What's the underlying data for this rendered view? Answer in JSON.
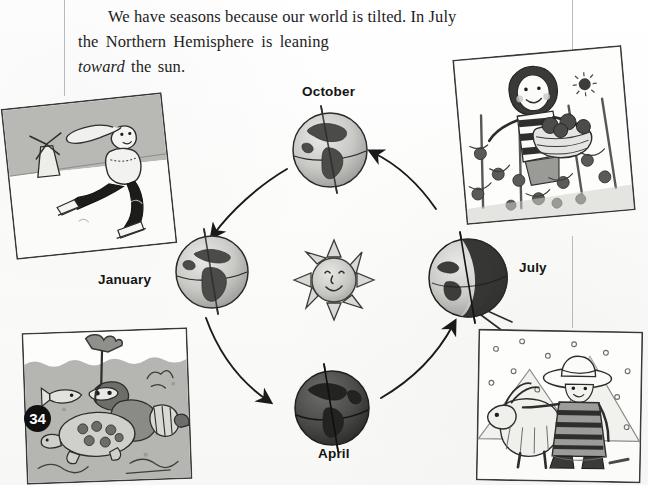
{
  "page": {
    "number": "34",
    "background_color": "#fdfdfc",
    "ink_color": "#1d1d1d"
  },
  "caption": {
    "line1": "We have seasons because our world is tilted. In July",
    "line2": "the Northern Hemisphere is leaning",
    "line3_emphasis": "toward",
    "line3_rest": " the sun."
  },
  "diagram": {
    "title_implied": "Earth's orbit and the seasons",
    "sun": {
      "label": "sun",
      "icon": "smiling-sun-icon",
      "center_x": 334,
      "center_y": 280,
      "radius": 30
    },
    "orbit": {
      "center_x": 334,
      "center_y": 280,
      "radius_x": 136,
      "radius_y": 130,
      "direction": "counterclockwise",
      "arrow_count": 4
    },
    "positions": [
      {
        "label": "October",
        "icon": "earth-globe-icon",
        "hemisphere_view": "Americas",
        "center_x": 330,
        "center_y": 150,
        "radius": 37,
        "label_x": 302,
        "label_y": 84
      },
      {
        "label": "January",
        "icon": "earth-globe-icon",
        "hemisphere_view": "Europe-Africa",
        "center_x": 212,
        "center_y": 272,
        "radius": 36,
        "label_x": 98,
        "label_y": 272
      },
      {
        "label": "April",
        "icon": "earth-globe-icon",
        "hemisphere_view": "night-side",
        "center_x": 332,
        "center_y": 408,
        "radius": 37,
        "label_x": 318,
        "label_y": 446
      },
      {
        "label": "July",
        "icon": "earth-globe-icon",
        "hemisphere_view": "terminator-shadow",
        "center_x": 468,
        "center_y": 278,
        "radius": 39,
        "label_x": 519,
        "label_y": 260
      }
    ]
  },
  "illustrations": [
    {
      "name": "ice-skating-scene",
      "season_label": "January",
      "description": "Child ice skating past a windmill in winter",
      "x": 8,
      "y": 100,
      "width": 160,
      "height": 150,
      "rotation": -6
    },
    {
      "name": "tomato-harvest-scene",
      "season_label": "July",
      "description": "Girl carrying a basket of tomatoes in a sunny garden",
      "x": 459,
      "y": 52,
      "width": 168,
      "height": 165,
      "rotation": -5
    },
    {
      "name": "snorkelling-scene",
      "season_label": "January",
      "description": "Snorkeller swimming with a sea turtle and fish",
      "x": 24,
      "y": 330,
      "width": 164,
      "height": 150,
      "rotation": -2
    },
    {
      "name": "andes-snow-scene",
      "season_label": "July",
      "description": "Person in a hat with a llama in falling snow near mountains",
      "x": 477,
      "y": 330,
      "width": 163,
      "height": 150,
      "rotation": 1
    }
  ],
  "rules": [
    {
      "name": "top-left-vertical-rule",
      "orientation": "vertical",
      "x": 64,
      "y": 0,
      "length": 96
    },
    {
      "name": "top-right-vertical-rule",
      "orientation": "vertical",
      "x": 572,
      "y": 0,
      "length": 50
    },
    {
      "name": "right-middle-rule",
      "orientation": "vertical",
      "x": 572,
      "y": 236,
      "length": 92
    }
  ]
}
